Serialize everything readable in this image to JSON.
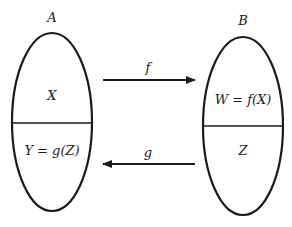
{
  "diagram": {
    "colors": {
      "stroke": "#1a1a1a",
      "background": "#ffffff"
    },
    "set_a": {
      "label": "A",
      "top_region": "X",
      "bottom_region": "Y = g(Z)"
    },
    "set_b": {
      "label": "B",
      "top_region": "W = f(X)",
      "bottom_region": "Z"
    },
    "arrows": [
      {
        "label": "f",
        "from": "A",
        "to": "B"
      },
      {
        "label": "g",
        "from": "B",
        "to": "A"
      }
    ]
  }
}
